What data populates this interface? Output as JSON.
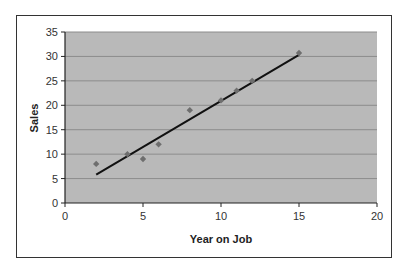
{
  "chart_data": {
    "type": "scatter",
    "title": "",
    "xlabel": "Year on Job",
    "ylabel": "Sales",
    "xlim": [
      0,
      20
    ],
    "ylim": [
      0,
      35
    ],
    "xticks": [
      0,
      5,
      10,
      15,
      20
    ],
    "yticks": [
      0,
      5,
      10,
      15,
      20,
      25,
      30,
      35
    ],
    "grid": {
      "horizontal": true,
      "vertical": false
    },
    "legend": null,
    "series": [
      {
        "name": "Sales",
        "type": "scatter",
        "marker": "diamond",
        "color": "#6e6e6e",
        "points": [
          {
            "x": 2,
            "y": 8
          },
          {
            "x": 4,
            "y": 10
          },
          {
            "x": 5,
            "y": 9
          },
          {
            "x": 6,
            "y": 12
          },
          {
            "x": 8,
            "y": 19
          },
          {
            "x": 10,
            "y": 21
          },
          {
            "x": 11,
            "y": 23
          },
          {
            "x": 12,
            "y": 25
          },
          {
            "x": 15,
            "y": 30.7
          }
        ]
      },
      {
        "name": "Linear trendline",
        "type": "line",
        "color": "#111111",
        "points": [
          {
            "x": 2,
            "y": 5.8
          },
          {
            "x": 15,
            "y": 30.3
          }
        ]
      }
    ],
    "colors": {
      "plot_background": "#b9b9b9",
      "gridline": "#8c8c8c",
      "frame": "#333333"
    }
  }
}
